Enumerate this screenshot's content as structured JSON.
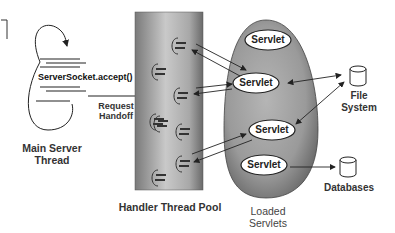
{
  "diagram": {
    "main_thread": {
      "label_line1": "Main Server",
      "label_line2": "Thread",
      "method": "ServerSocket.accept()"
    },
    "handoff": {
      "line1": "Request",
      "line2": "Handoff"
    },
    "thread_pool": {
      "label": "Handler Thread Pool",
      "thread_count": 8
    },
    "servlets_container": {
      "label_line1": "Loaded",
      "label_line2": "Servlets",
      "servlets": [
        {
          "label": "Servlet"
        },
        {
          "label": "Servlet"
        },
        {
          "label": "Servlet"
        },
        {
          "label": "Servlet"
        }
      ]
    },
    "resources": {
      "file_system": {
        "line1": "File",
        "line2": "System"
      },
      "databases": {
        "label": "Databases"
      }
    },
    "colors": {
      "line": "#222222",
      "pool_fill_center": "#c8c8c8",
      "pool_fill_edge": "#6a6a6a",
      "blob_fill": "#9a9a9a",
      "text": "#333333"
    }
  }
}
